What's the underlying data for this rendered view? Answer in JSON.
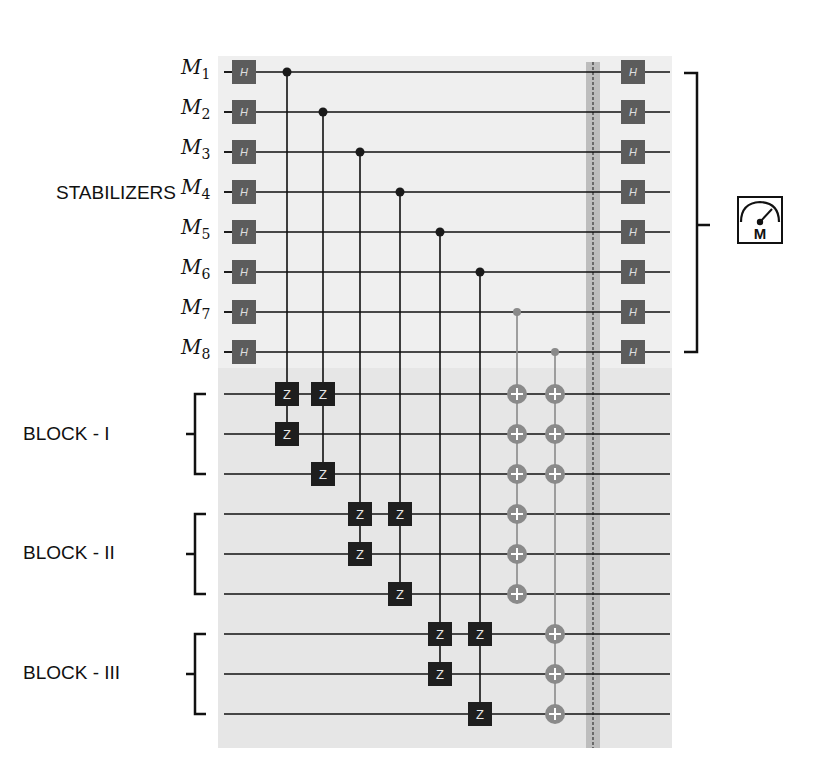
{
  "labels": {
    "stabilizers": "STABILIZERS",
    "block1": "BLOCK - I",
    "block2": "BLOCK - II",
    "block3": "BLOCK - III",
    "measure_glyph": "M"
  },
  "qubits": [
    {
      "name": "M",
      "sub": "1"
    },
    {
      "name": "M",
      "sub": "2"
    },
    {
      "name": "M",
      "sub": "3"
    },
    {
      "name": "M",
      "sub": "4"
    },
    {
      "name": "M",
      "sub": "5"
    },
    {
      "name": "M",
      "sub": "6"
    },
    {
      "name": "M",
      "sub": "7"
    },
    {
      "name": "M",
      "sub": "8"
    }
  ],
  "gates": {
    "hadamard": "H",
    "z": "Z"
  },
  "colors": {
    "h_gate": "#5c5c5c",
    "z_gate": "#1e1e1e",
    "cnot": "#8a8a8a",
    "wire": "#111111",
    "bg_stabilizer": "#efefef",
    "bg_data": "#e6e6e6",
    "barrier": "#bdbdbd"
  },
  "layout": {
    "stab_rows_y": [
      72,
      112,
      152,
      192,
      232,
      272,
      312,
      352
    ],
    "data_rows_y": [
      394,
      434,
      474,
      514,
      554,
      594,
      634,
      674,
      714
    ],
    "cz_columns": [
      {
        "x": 287,
        "ctrl": 0,
        "targets": [
          0,
          1
        ]
      },
      {
        "x": 323,
        "ctrl": 1,
        "targets": [
          0,
          2
        ]
      },
      {
        "x": 360,
        "ctrl": 2,
        "targets": [
          3,
          4
        ]
      },
      {
        "x": 400,
        "ctrl": 3,
        "targets": [
          3,
          5
        ]
      },
      {
        "x": 440,
        "ctrl": 4,
        "targets": [
          6,
          7
        ]
      },
      {
        "x": 480,
        "ctrl": 5,
        "targets": [
          6,
          8
        ]
      }
    ],
    "cnot_columns": [
      {
        "x": 517,
        "ctrl": 6,
        "targets": [
          0,
          1,
          2,
          3,
          4,
          5
        ]
      },
      {
        "x": 555,
        "ctrl": 7,
        "targets": [
          0,
          1,
          2,
          6,
          7,
          8
        ]
      }
    ]
  }
}
